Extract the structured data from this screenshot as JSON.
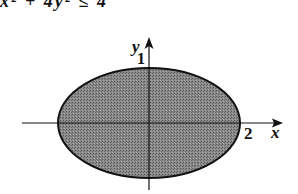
{
  "header": {
    "cropped_text": "x² + 4y² ≤ 4"
  },
  "diagram": {
    "type": "ellipse-region",
    "axes": {
      "x_label": "x",
      "y_label": "y"
    },
    "ticks": {
      "x_intercept": "2",
      "y_intercept": "1"
    },
    "ellipse": {
      "semi_major_x": 2,
      "semi_minor_y": 1,
      "fill": "#7a7a7a",
      "stroke": "#111111"
    }
  }
}
